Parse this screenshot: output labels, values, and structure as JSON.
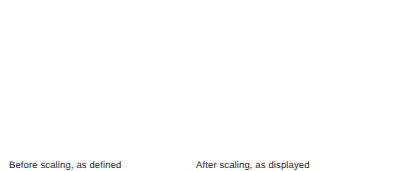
{
  "figure": {
    "name": "raster-scaling-illustration",
    "background_color": "#ffffff",
    "dot_color": "#262626",
    "text_color": "#1d1d1d",
    "width": 394,
    "height": 171
  },
  "captions": {
    "before": {
      "line1": "Before scaling, as defined",
      "line2": "in frame buffer"
    },
    "after": {
      "line1": "After scaling, as displayed"
    }
  },
  "diagram_data": {
    "type": "raster-dot-matrix",
    "description": "Two pairs of dot-matrix figures showing a letter I and a diagonal line, before and after 2x pixel replication scaling.",
    "scale_factor": 2,
    "dot_radius_small": 7.2,
    "dot_radius_large": 7.2,
    "groups": [
      {
        "name": "before-letter-i",
        "label": "letter-I-unscaled",
        "origin_x": 25,
        "origin_y": 85,
        "cell": 14.0,
        "cluster": 1,
        "cells": [
          [
            0,
            0
          ],
          [
            1,
            0
          ],
          [
            2,
            0
          ],
          [
            1,
            1
          ],
          [
            1,
            2
          ],
          [
            1,
            3
          ],
          [
            0,
            4
          ],
          [
            1,
            4
          ],
          [
            2,
            4
          ]
        ]
      },
      {
        "name": "before-diagonal",
        "label": "diagonal-line-unscaled",
        "origin_x": 81,
        "origin_y": 125,
        "cell": 14.0,
        "cluster": 1,
        "cells": [
          [
            0,
            0
          ],
          [
            1,
            -1
          ],
          [
            2,
            -2
          ],
          [
            3,
            -3
          ],
          [
            4,
            -4
          ]
        ]
      },
      {
        "name": "after-letter-i",
        "label": "letter-I-scaled",
        "origin_x": 174,
        "origin_y": 40,
        "cell": 14.0,
        "cluster": 2,
        "cells": [
          [
            0,
            0
          ],
          [
            1,
            0
          ],
          [
            2,
            0
          ],
          [
            1,
            1
          ],
          [
            1,
            2
          ],
          [
            1,
            3
          ],
          [
            0,
            4
          ],
          [
            1,
            4
          ],
          [
            2,
            4
          ]
        ]
      },
      {
        "name": "after-diagonal",
        "label": "diagonal-line-scaled",
        "origin_x": 269,
        "origin_y": 118,
        "cell": 26.5,
        "cluster": 2,
        "cells": [
          [
            0,
            0
          ],
          [
            1,
            -1
          ],
          [
            2,
            -2
          ],
          [
            3,
            -3
          ],
          [
            4,
            -4
          ]
        ]
      }
    ]
  }
}
